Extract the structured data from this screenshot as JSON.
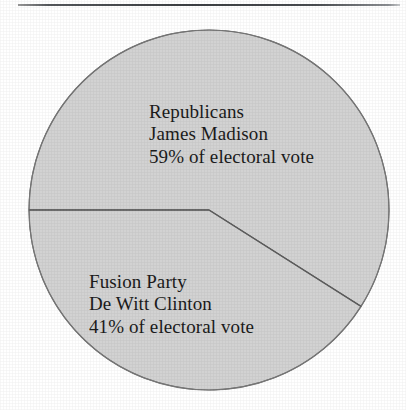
{
  "figure": {
    "background_color": "#ffffff",
    "rule_color": "#3c3f43",
    "wedge_fill_color": "#d2d2d2",
    "wedge_stroke_color": "#6f6f6f",
    "text_color": "#1b1b1b"
  },
  "chart_data": {
    "type": "pie",
    "title": "",
    "subtitle": "",
    "xlabel": "",
    "ylabel": "",
    "grid": false,
    "legend_position": "inside-slices",
    "units": "percent of electoral vote",
    "center_x": 209,
    "center_y": 210,
    "radius": 180,
    "start_angle_deg": 180,
    "direction": "clockwise",
    "categories": [
      "Republicans",
      "Fusion Party"
    ],
    "values": [
      59,
      41
    ],
    "slices": [
      {
        "party": "Republicans",
        "candidate": "James Madison",
        "value": 59,
        "value_label": "59% of electoral vote",
        "fill": "#d2d2d2"
      },
      {
        "party": "Fusion Party",
        "candidate": "De Witt Clinton",
        "value": 41,
        "value_label": "41% of electoral vote",
        "fill": "#d2d2d2"
      }
    ],
    "annotations": [
      {
        "name": "republicans-label",
        "lines": [
          "Republicans",
          "James Madison",
          "59% of electoral vote"
        ]
      },
      {
        "name": "fusion-label",
        "lines": [
          "Fusion Party",
          "De Witt Clinton",
          "41% of electoral vote"
        ]
      }
    ]
  },
  "labels": {
    "republicans": {
      "party": "Republicans",
      "candidate": "James Madison",
      "share": "59% of electoral vote"
    },
    "fusion": {
      "party": "Fusion Party",
      "candidate": "De Witt Clinton",
      "share": "41% of electoral vote"
    }
  }
}
